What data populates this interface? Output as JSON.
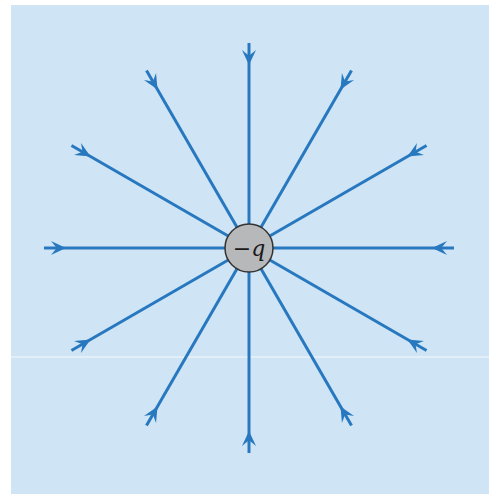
{
  "diagram": {
    "charge_label": "−q",
    "center": [
      249,
      248
    ],
    "charge_radius": 24,
    "line_count": 12,
    "angle_step_deg": 30,
    "inner_radius": 24,
    "outer_radius": 205,
    "arrow_offset_from_outer": 22,
    "arrow_direction": "inward",
    "colors": {
      "background": "#cfe5f5",
      "panel_border": "#ffffff",
      "field_line": "#2878bf",
      "charge_fill": "#b7b8ba",
      "charge_stroke": "#333333",
      "label": "#1a1a1a"
    }
  }
}
